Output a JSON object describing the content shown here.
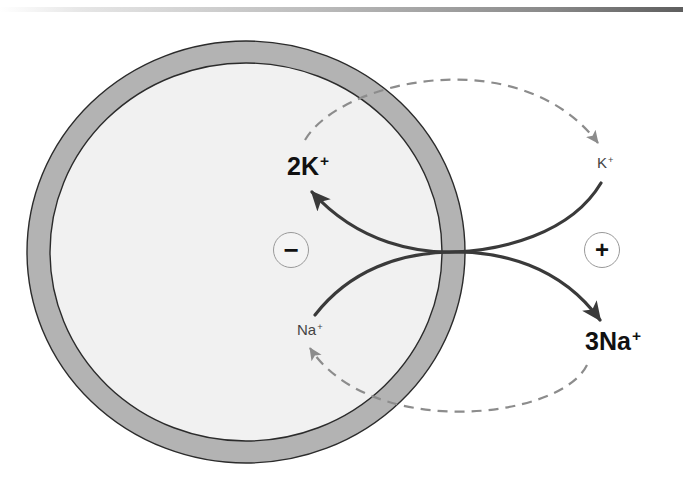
{
  "diagram": {
    "cell": {
      "fill": "#f1f1f1",
      "membrane_color": "#b3b3b3",
      "outline": "#2b2b2b"
    },
    "colors": {
      "solid_arrow": "#3a3a3a",
      "dashed_arrow": "#8c8c8c"
    },
    "labels": {
      "inside_potassium": {
        "text": "2K",
        "sup": "+"
      },
      "outside_potassium": {
        "text": "K",
        "sup": "+"
      },
      "inside_sodium": {
        "text": "Na",
        "sup": "+"
      },
      "outside_sodium": {
        "text": "3Na",
        "sup": "+"
      }
    },
    "charges": {
      "inside": "−",
      "outside": "+"
    }
  }
}
